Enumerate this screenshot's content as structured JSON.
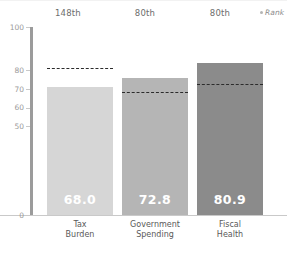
{
  "chart_data": {
    "type": "bar",
    "title": "",
    "subtitle": "",
    "xlabel": "",
    "ylabel": "",
    "ylim": [
      0,
      100
    ],
    "grid": false,
    "legend_position": "top-right",
    "categories": [
      "Tax\nBurden",
      "Government\nSpending",
      "Fiscal\nHealth"
    ],
    "values": [
      68.0,
      72.8,
      80.9
    ],
    "value_labels": [
      "68.0",
      "72.8",
      "80.9"
    ],
    "ranks": [
      "148th",
      "80th",
      "80th"
    ],
    "reference_lines": [
      78.0,
      65.2,
      69.5
    ],
    "reference_line_style": "dashed",
    "y_ticks": [
      100,
      80,
      70,
      60,
      50,
      0
    ],
    "y_tick_labels": [
      "100",
      "80",
      "70",
      "60",
      "50",
      "0"
    ],
    "bar_colors": [
      "#d6d6d6",
      "#b5b5b5",
      "#8b8b8b"
    ],
    "series": [
      {
        "name": "Score",
        "values": [
          68.0,
          72.8,
          80.9
        ]
      },
      {
        "name": "World Average",
        "values": [
          78.0,
          65.2,
          69.5
        ]
      }
    ]
  },
  "legend": {
    "rank_label": "Rank",
    "rank_marker": "dot-icon"
  },
  "axis": {
    "axis_color": "#9b9b9b",
    "tick_color": "#c9c9c9",
    "label_color": "#9a9a9a"
  }
}
